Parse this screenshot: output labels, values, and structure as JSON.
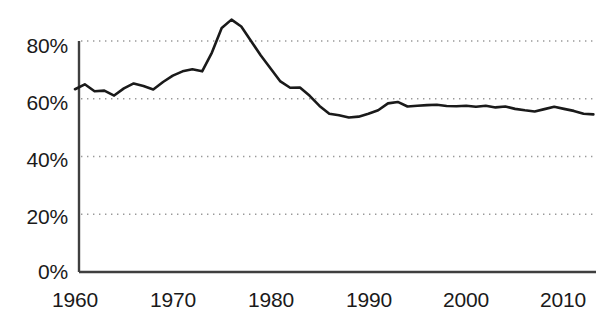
{
  "chart_data": {
    "type": "line",
    "title": "",
    "subtitle": "",
    "xlabel": "",
    "ylabel": "",
    "xlim": [
      1960,
      2013
    ],
    "ylim": [
      0,
      88
    ],
    "y_axis_visible_max_tick": 80,
    "grid": true,
    "grid_style": "dotted-horizontal",
    "legend": null,
    "legend_position": "none",
    "line_color": "#1a1a1a",
    "axis_color": "#4a4a4a",
    "grid_color": "#999999",
    "background_color": "#ffffff",
    "ytick_labels": [
      "0%",
      "20%",
      "40%",
      "60%",
      "80%"
    ],
    "ytick_values": [
      0,
      20,
      40,
      60,
      80
    ],
    "xtick_labels": [
      "1960",
      "1970",
      "1980",
      "1990",
      "2000",
      "2010"
    ],
    "xtick_values": [
      1960,
      1970,
      1980,
      1990,
      2000,
      2010
    ],
    "x": [
      1960,
      1961,
      1962,
      1963,
      1964,
      1965,
      1966,
      1967,
      1968,
      1969,
      1970,
      1971,
      1972,
      1973,
      1974,
      1975,
      1976,
      1977,
      1978,
      1979,
      1980,
      1981,
      1982,
      1983,
      1984,
      1985,
      1986,
      1987,
      1988,
      1989,
      1990,
      1991,
      1992,
      1993,
      1994,
      1995,
      1996,
      1997,
      1998,
      1999,
      2000,
      2001,
      2002,
      2003,
      2004,
      2005,
      2006,
      2007,
      2008,
      2009,
      2010,
      2011,
      2012,
      2013
    ],
    "values": [
      63.3,
      65.0,
      62.6,
      62.8,
      61.1,
      63.6,
      65.3,
      64.4,
      63.2,
      65.8,
      68.0,
      69.5,
      70.2,
      69.5,
      76.0,
      84.5,
      87.4,
      85.0,
      80.0,
      75.0,
      70.5,
      66.0,
      63.8,
      63.9,
      61.0,
      57.5,
      54.8,
      54.3,
      53.5,
      53.8,
      54.8,
      56.0,
      58.4,
      58.9,
      57.3,
      57.6,
      57.8,
      57.9,
      57.5,
      57.4,
      57.6,
      57.2,
      57.6,
      57.0,
      57.3,
      56.5,
      56.0,
      55.6,
      56.4,
      57.2,
      56.5,
      55.8,
      54.8,
      54.6
    ],
    "series": [
      {
        "name": "series-1",
        "values": [
          63.3,
          65.0,
          62.6,
          62.8,
          61.1,
          63.6,
          65.3,
          64.4,
          63.2,
          65.8,
          68.0,
          69.5,
          70.2,
          69.5,
          76.0,
          84.5,
          87.4,
          85.0,
          80.0,
          75.0,
          70.5,
          66.0,
          63.8,
          63.9,
          61.0,
          57.5,
          54.8,
          54.3,
          53.5,
          53.8,
          54.8,
          56.0,
          58.4,
          58.9,
          57.3,
          57.6,
          57.8,
          57.9,
          57.5,
          57.4,
          57.6,
          57.2,
          57.6,
          57.0,
          57.3,
          56.5,
          56.0,
          55.6,
          56.4,
          57.2,
          56.5,
          55.8,
          54.8,
          54.6
        ]
      }
    ]
  },
  "axes": {
    "y_ticks": [
      {
        "label": "80%",
        "value": 80
      },
      {
        "label": "60%",
        "value": 60
      },
      {
        "label": "40%",
        "value": 40
      },
      {
        "label": "20%",
        "value": 20
      },
      {
        "label": "0%",
        "value": 0
      }
    ],
    "x_ticks": [
      {
        "label": "1960",
        "value": 1960
      },
      {
        "label": "1970",
        "value": 1970
      },
      {
        "label": "1980",
        "value": 1980
      },
      {
        "label": "1990",
        "value": 1990
      },
      {
        "label": "2000",
        "value": 2000
      },
      {
        "label": "2010",
        "value": 2010
      }
    ]
  }
}
